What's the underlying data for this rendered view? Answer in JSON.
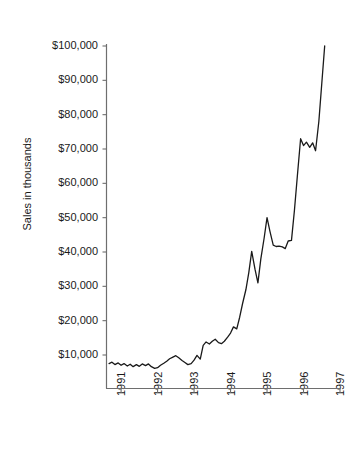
{
  "chart_data": {
    "type": "line",
    "title": "",
    "xlabel": "",
    "ylabel": "Sales in thousands",
    "ylim": [
      0,
      100000
    ],
    "xlim": [
      1990.6,
      1997.0
    ],
    "grid": false,
    "legend": false,
    "y_tick_labels": [
      "$10,000",
      "$20,000",
      "$30,000",
      "$40,000",
      "$50,000",
      "$60,000",
      "$70,000",
      "$80,000",
      "$90,000",
      "$100,000"
    ],
    "y_tick_values": [
      10000,
      20000,
      30000,
      40000,
      50000,
      60000,
      70000,
      80000,
      90000,
      100000
    ],
    "x_tick_labels": [
      "1991",
      "1992",
      "1993",
      "1994",
      "1995",
      "1996",
      "1997"
    ],
    "x_tick_values": [
      1991,
      1992,
      1993,
      1994,
      1995,
      1996,
      1997
    ],
    "line_color": "#1a1a1a",
    "series": [
      {
        "name": "Sales",
        "x": [
          1990.67,
          1990.75,
          1990.83,
          1990.92,
          1991.0,
          1991.08,
          1991.17,
          1991.25,
          1991.33,
          1991.42,
          1991.5,
          1991.58,
          1991.67,
          1991.75,
          1991.83,
          1991.92,
          1992.0,
          1992.08,
          1992.17,
          1992.25,
          1992.33,
          1992.42,
          1992.5,
          1992.58,
          1992.67,
          1992.75,
          1992.83,
          1992.92,
          1993.0,
          1993.08,
          1993.17,
          1993.25,
          1993.33,
          1993.42,
          1993.5,
          1993.58,
          1993.67,
          1993.75,
          1993.83,
          1993.92,
          1994.0,
          1994.08,
          1994.17,
          1994.25,
          1994.33,
          1994.42,
          1994.5,
          1994.58,
          1994.67,
          1994.75,
          1994.83,
          1994.92,
          1995.0,
          1995.08,
          1995.17,
          1995.25,
          1995.33,
          1995.42,
          1995.5,
          1995.58,
          1995.67,
          1995.75,
          1995.83,
          1995.92,
          1996.0,
          1996.08,
          1996.17,
          1996.25,
          1996.33,
          1996.42,
          1996.5,
          1996.58
        ],
        "values": [
          7500,
          7900,
          7200,
          7700,
          7000,
          7500,
          6800,
          7300,
          6600,
          7200,
          6700,
          7400,
          6900,
          7400,
          6600,
          6100,
          6300,
          7000,
          7600,
          8200,
          8900,
          9400,
          9800,
          9200,
          8400,
          7800,
          7200,
          7500,
          8500,
          9900,
          8800,
          12800,
          13800,
          13200,
          14000,
          14600,
          13600,
          13300,
          14000,
          15200,
          16400,
          18200,
          17600,
          21000,
          25000,
          29000,
          34000,
          40200,
          35000,
          31000,
          38000,
          44000,
          50000,
          46000,
          42000,
          41600,
          41700,
          41500,
          41000,
          43200,
          43400,
          52000,
          62000,
          73000,
          71000,
          72000,
          70500,
          71800,
          69500,
          78000,
          89000,
          100000
        ]
      }
    ]
  },
  "axis": {
    "y_title": "Sales in thousands"
  }
}
